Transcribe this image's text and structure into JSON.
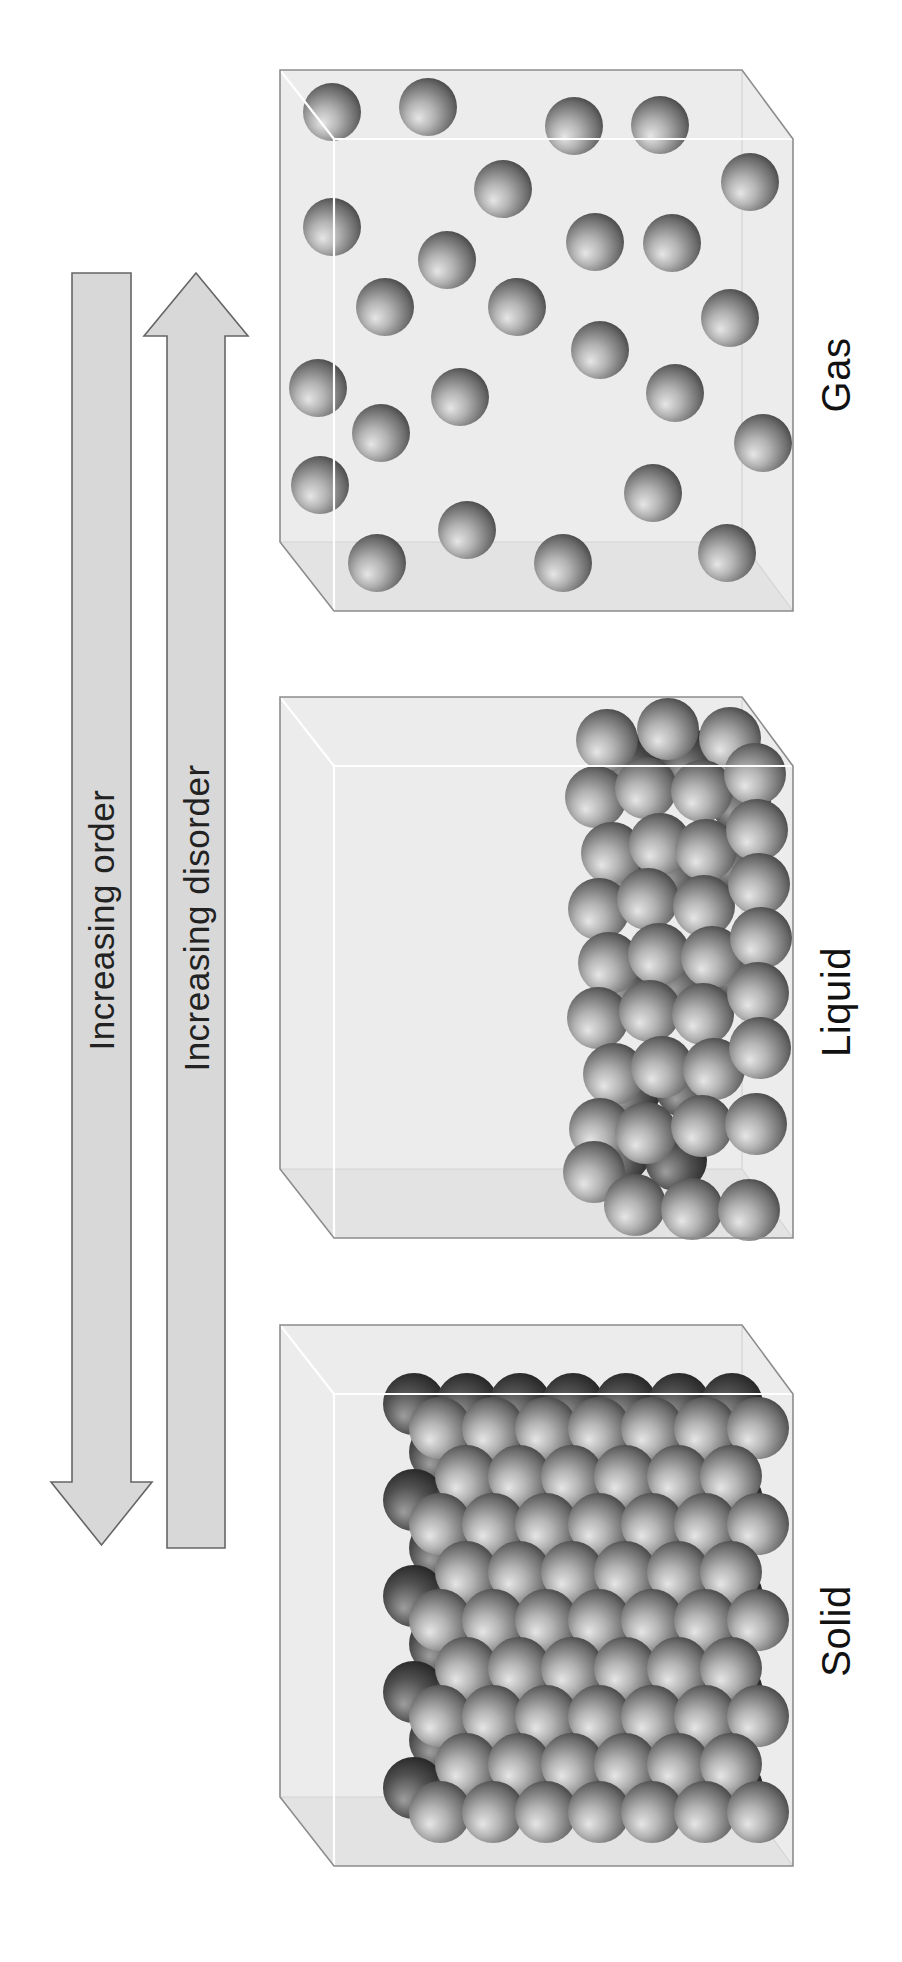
{
  "figure": {
    "background": "#ffffff"
  },
  "arrows": {
    "order": {
      "label": "Increasing order",
      "direction": "down"
    },
    "disorder": {
      "label": "Increasing disorder",
      "direction": "up"
    }
  },
  "boxes": [
    {
      "id": "gas",
      "label": "Gas",
      "y": 70,
      "sphere_radius": 29,
      "spheres": [
        [
          332,
          112
        ],
        [
          428,
          107
        ],
        [
          574,
          126
        ],
        [
          660,
          125
        ],
        [
          750,
          182
        ],
        [
          503,
          189
        ],
        [
          332,
          227
        ],
        [
          447,
          260
        ],
        [
          595,
          242
        ],
        [
          672,
          243
        ],
        [
          385,
          307
        ],
        [
          517,
          307
        ],
        [
          730,
          318
        ],
        [
          600,
          350
        ],
        [
          318,
          388
        ],
        [
          460,
          397
        ],
        [
          675,
          393
        ],
        [
          381,
          433
        ],
        [
          763,
          443
        ],
        [
          320,
          485
        ],
        [
          653,
          493
        ],
        [
          467,
          530
        ],
        [
          377,
          563
        ],
        [
          563,
          563
        ],
        [
          727,
          553
        ]
      ],
      "back_spheres": []
    },
    {
      "id": "liquid",
      "label": "Liquid",
      "y": 697,
      "sphere_radius": 31,
      "back_spheres": [
        [
          633,
          765
        ],
        [
          690,
          760
        ],
        [
          740,
          800
        ],
        [
          625,
          872
        ],
        [
          678,
          868
        ],
        [
          736,
          858
        ],
        [
          628,
          982
        ],
        [
          683,
          978
        ],
        [
          738,
          966
        ],
        [
          630,
          1090
        ],
        [
          686,
          1087
        ],
        [
          620,
          1152
        ],
        [
          676,
          1160
        ]
      ],
      "spheres": [
        [
          607,
          740
        ],
        [
          668,
          729
        ],
        [
          730,
          738
        ],
        [
          596,
          797
        ],
        [
          646,
          788
        ],
        [
          702,
          791
        ],
        [
          755,
          774
        ],
        [
          612,
          853
        ],
        [
          660,
          844
        ],
        [
          706,
          850
        ],
        [
          757,
          830
        ],
        [
          599,
          909
        ],
        [
          648,
          899
        ],
        [
          704,
          906
        ],
        [
          759,
          884
        ],
        [
          609,
          963
        ],
        [
          659,
          954
        ],
        [
          712,
          957
        ],
        [
          761,
          938
        ],
        [
          598,
          1018
        ],
        [
          650,
          1011
        ],
        [
          703,
          1014
        ],
        [
          758,
          993
        ],
        [
          614,
          1074
        ],
        [
          662,
          1067
        ],
        [
          714,
          1069
        ],
        [
          760,
          1048
        ],
        [
          600,
          1129
        ],
        [
          646,
          1133
        ],
        [
          702,
          1126
        ],
        [
          756,
          1124
        ],
        [
          594,
          1172
        ],
        [
          635,
          1205
        ],
        [
          692,
          1209
        ],
        [
          749,
          1210
        ]
      ]
    },
    {
      "id": "solid",
      "label": "Solid",
      "y": 1325,
      "sphere_radius": 31,
      "lattice": {
        "rows": 9,
        "y0": 1428,
        "pitch_y": 48,
        "pitch_x": 53,
        "x0_even": 440,
        "cols_even": 7,
        "x0_odd": 466,
        "cols_odd": 6,
        "back_dx": -26,
        "back_dy": -24
      }
    }
  ],
  "colors": {
    "background": "#ffffff",
    "box_fill": "#ececec",
    "floor_fill": "#e3e3e3",
    "edge": "#8c8c8c",
    "inner_edge": "#ffffff",
    "faint_edge": "#d4d4d4",
    "label": "#111111",
    "arrow_fill": "#d8d8d8",
    "arrow_stroke": "#666666",
    "arrow_text": "#222222",
    "sphere_highlight": "#e6e6e6",
    "sphere_mid": "#6a6a6a",
    "sphere_dark": "#161616",
    "sphere_back_light": "#9e9e9e",
    "sphere_back_dark": "#0a0a0a"
  }
}
